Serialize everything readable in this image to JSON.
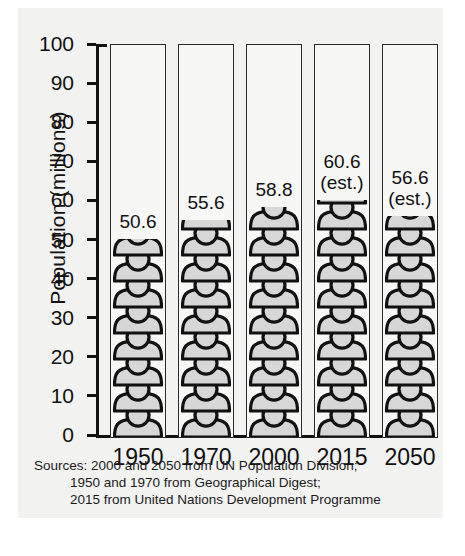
{
  "chart_data": {
    "type": "bar",
    "title": "",
    "subtitle": "",
    "xlabel": "",
    "ylabel": "Population (millions)",
    "categories": [
      "1950",
      "1970",
      "2000",
      "2015",
      "2050"
    ],
    "values": [
      50.6,
      55.6,
      58.8,
      60.6,
      56.6
    ],
    "value_labels": [
      "50.6",
      "55.6",
      "58.8",
      "60.6",
      "56.6"
    ],
    "annotations": [
      "",
      "",
      "",
      "(est.)",
      "(est.)"
    ],
    "ylim": [
      0,
      100
    ],
    "yticks": [
      0,
      10,
      20,
      30,
      40,
      50,
      60,
      70,
      80,
      90,
      100
    ],
    "ytick_labels": [
      "0",
      "10",
      "20",
      "30",
      "40",
      "50",
      "60",
      "70",
      "80",
      "90",
      "100"
    ],
    "grid": false,
    "legend": "none",
    "bar_style": "pictogram-stacked-people",
    "colors": {
      "bar_fill": "#d7d7d7",
      "bar_outline": "#111111",
      "column_frame": "#2b2b2b",
      "panel_background": "#f2f2f1",
      "text": "#111111"
    }
  },
  "sources": {
    "line1": "Sources: 2000 and 2050 from UN Population Division;",
    "line2": "1950 and 1970 from Geographical Digest;",
    "line3": "2015 from United Nations Development Programme"
  }
}
